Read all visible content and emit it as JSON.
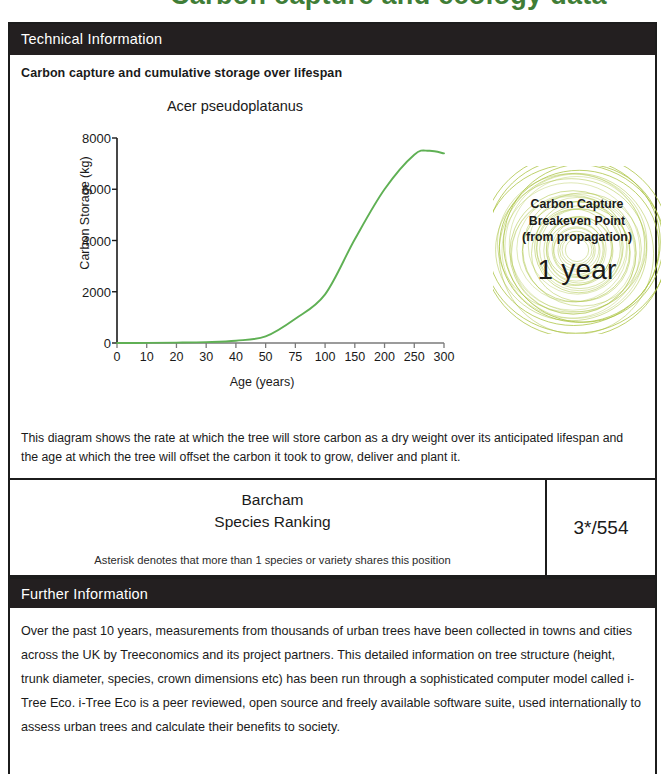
{
  "top_heading_fragment": "Carbon capture and ecology data",
  "sections": {
    "technical": {
      "band_label": "Technical Information",
      "sub_title": "Carbon capture and cumulative storage over lifespan",
      "note": "This diagram shows the rate at which the tree will store carbon as a dry weight over its anticipated lifespan and the age at which the tree will offset the carbon it took to grow, deliver and plant it."
    },
    "further": {
      "band_label": "Further Information",
      "body": "Over the past 10 years, measurements from thousands of urban trees have been collected in towns and cities across the UK by Treeconomics and its project partners. This detailed information on tree structure (height, trunk diameter, species, crown dimensions etc) has been run through a sophisticated computer model called i-Tree Eco. i-Tree Eco is a peer reviewed, open source and freely available software suite, used internationally to assess urban trees and calculate their benefits to society."
    }
  },
  "badge": {
    "line1": "Carbon Capture",
    "line2": "Breakeven Point",
    "line3": "(from propagation)",
    "value": "1 year",
    "ring_color": "#a9c23f"
  },
  "ranking": {
    "title_line1": "Barcham",
    "title_line2": "Species Ranking",
    "value": "3*/554",
    "footnote": "Asterisk denotes that more than 1 species or variety shares this position"
  },
  "colors": {
    "band": "#231f20",
    "border": "#1c1c1c",
    "curve": "#5fb054",
    "heading_green": "#3f7d36"
  },
  "chart_data": {
    "type": "line",
    "title": "Acer pseudoplatanus",
    "xlabel": "Age (years)",
    "ylabel": "Carbon Storage (kg)",
    "grid": false,
    "legend": "none",
    "x_tick_labels": [
      "0",
      "10",
      "20",
      "30",
      "40",
      "50",
      "75",
      "100",
      "150",
      "200",
      "250",
      "300"
    ],
    "x_scale": "ordinal-even-spacing",
    "y_tick_labels": [
      "0",
      "2000",
      "4000",
      "6000",
      "8000"
    ],
    "ylim": [
      0,
      8000
    ],
    "series": [
      {
        "name": "Carbon storage",
        "color": "#5fb054",
        "x": [
          0,
          10,
          20,
          30,
          40,
          50,
          75,
          100,
          150,
          200,
          250,
          300
        ],
        "values": [
          0,
          5,
          15,
          35,
          90,
          260,
          950,
          1900,
          4050,
          6000,
          7350,
          7400
        ]
      }
    ],
    "annotations": {
      "peak_value": 7500,
      "peak_age": 275
    }
  }
}
